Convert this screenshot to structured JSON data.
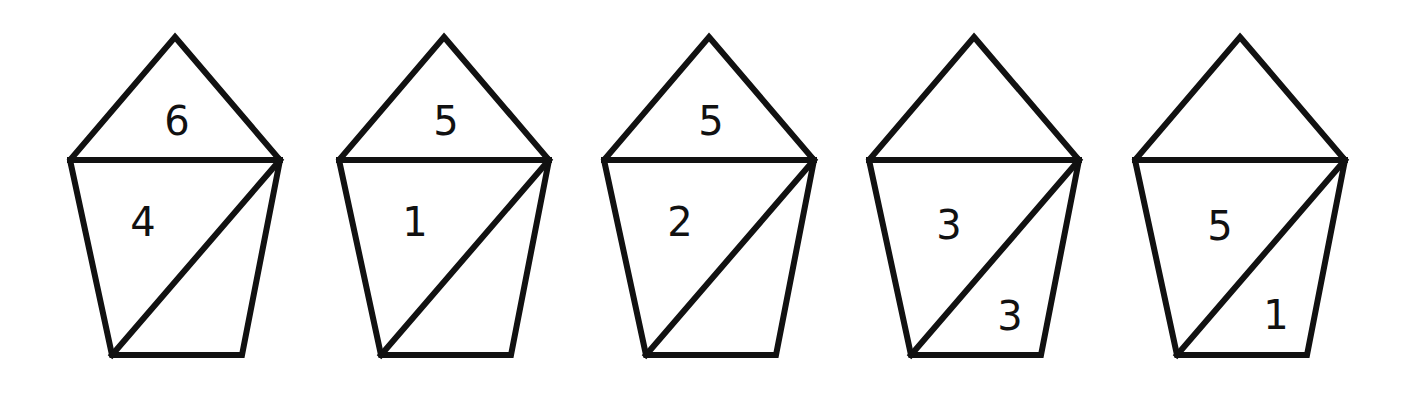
{
  "figure": {
    "stroke_color": "#111111",
    "background": "#ffffff"
  },
  "pentagons": [
    {
      "top": "6",
      "left": "4",
      "right": ""
    },
    {
      "top": "5",
      "left": "1",
      "right": ""
    },
    {
      "top": "5",
      "left": "2",
      "right": ""
    },
    {
      "top": "",
      "left": "3",
      "right": "3"
    },
    {
      "top": "",
      "left": "5",
      "right": "1"
    }
  ]
}
